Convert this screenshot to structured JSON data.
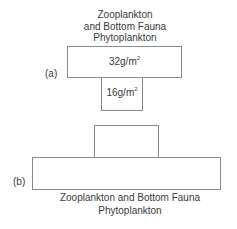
{
  "diagram": {
    "type": "ecological pyramid comparison",
    "panel_a": {
      "label": "(a)",
      "legend_lines": [
        "Zooplankton",
        "and Bottom Fauna",
        "Phytoplankton"
      ],
      "levels": [
        {
          "name": "Zooplankton and Bottom Fauna",
          "value": "32g/m",
          "unit_exp": "2",
          "position": "top",
          "width": "wide"
        },
        {
          "name": "Phytoplankton",
          "value": "16g/m",
          "unit_exp": "2",
          "position": "bottom",
          "width": "narrow"
        }
      ]
    },
    "panel_b": {
      "label": "(b)",
      "legend_lines": [
        "Zooplankton and Bottom Fauna",
        "Phytoplankton"
      ],
      "levels": [
        {
          "name": "Zooplankton and Bottom Fauna",
          "position": "top",
          "width": "narrow"
        },
        {
          "name": "Phytoplankton",
          "position": "bottom",
          "width": "wide"
        }
      ]
    },
    "colors": {
      "line": "#8a8a8a",
      "text": "#3a3a3a",
      "background": "#ffffff"
    }
  }
}
